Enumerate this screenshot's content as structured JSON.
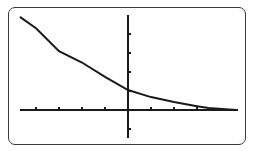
{
  "calculator_screen": {
    "description": "Graphing calculator display of a decreasing exponential curve",
    "colors": {
      "background": "#ffffff",
      "ink": "#1a1a1a",
      "frame": "#3a3a3a"
    }
  },
  "chart_data": {
    "type": "line",
    "title": "",
    "xlabel": "",
    "ylabel": "",
    "grid": false,
    "xlim": [
      -4.7,
      4.7
    ],
    "ylim": [
      -1.5,
      5
    ],
    "x_ticks": [
      -4,
      -3,
      -2,
      -1,
      1,
      2,
      3
    ],
    "y_ticks": [
      -1,
      1,
      2,
      3,
      4
    ],
    "series": [
      {
        "name": "y = f(x) (exponential decay)",
        "x": [
          -4.7,
          -4,
          -3,
          -2,
          -1,
          0,
          1,
          2,
          3,
          3.5,
          4.7
        ],
        "y": [
          4.9,
          4.3,
          3.1,
          2.5,
          1.75,
          1.05,
          0.68,
          0.42,
          0.2,
          0.1,
          0.0
        ]
      }
    ]
  }
}
